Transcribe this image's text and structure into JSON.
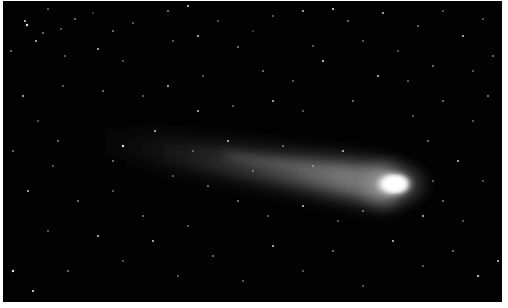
{
  "image": {
    "subject": "Comet with long diffuse tail against a dense starfield",
    "alt": "Bright comet nucleus at right with faint tail extending to the upper left, surrounded by stars",
    "colors": {
      "sky": "#020202",
      "nucleus": "#ffffff",
      "coma": "#d8d8d8",
      "tail": "#8a8a8a",
      "stars": "#e6e6e6",
      "border": "#ffffff"
    },
    "comet": {
      "nucleus_center": [
        393,
        184
      ],
      "nucleus_size": [
        36,
        22
      ],
      "tail_end": [
        85,
        138
      ]
    }
  }
}
